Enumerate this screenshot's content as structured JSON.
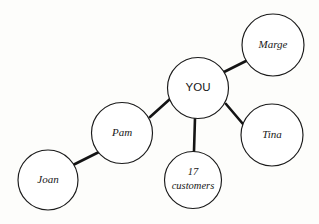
{
  "diagram": {
    "background_color": "#fdfdfb",
    "line_color": "#141414",
    "node_fill": "#ffffff",
    "node_stroke": "#1a1a1a",
    "nodes": [
      {
        "id": "you",
        "label": "YOU",
        "label_lines": [
          "YOU"
        ],
        "style": "roman",
        "font_size": 11.5,
        "cx": 198,
        "cy": 88,
        "r": 30.5
      },
      {
        "id": "marge",
        "label": "Marge",
        "label_lines": [
          "Marge"
        ],
        "style": "italic",
        "font_size": 11,
        "cx": 273,
        "cy": 45,
        "r": 31
      },
      {
        "id": "tina",
        "label": "Tina",
        "label_lines": [
          "Tina"
        ],
        "style": "italic",
        "font_size": 11,
        "cx": 272,
        "cy": 135,
        "r": 31
      },
      {
        "id": "pam",
        "label": "Pam",
        "label_lines": [
          "Pam"
        ],
        "style": "italic",
        "font_size": 11,
        "cx": 122,
        "cy": 133,
        "r": 30.5
      },
      {
        "id": "joan",
        "label": "Joan",
        "label_lines": [
          "Joan"
        ],
        "style": "italic",
        "font_size": 11,
        "cx": 48,
        "cy": 180,
        "r": 30
      },
      {
        "id": "customers",
        "label": "17 customers",
        "label_lines": [
          "17",
          "customers"
        ],
        "style": "italic",
        "font_size": 10.5,
        "cx": 193,
        "cy": 180,
        "r": 28.5
      }
    ],
    "edges": [
      {
        "id": "you-marge",
        "from": "you",
        "to": "marge",
        "x1": 224,
        "y1": 72,
        "x2": 248,
        "y2": 60
      },
      {
        "id": "you-tina",
        "from": "you",
        "to": "tina",
        "x1": 226,
        "y1": 104,
        "x2": 243,
        "y2": 124
      },
      {
        "id": "you-customers",
        "from": "you",
        "to": "customers",
        "x1": 195,
        "y1": 118,
        "x2": 194,
        "y2": 151
      },
      {
        "id": "you-pam",
        "from": "you",
        "to": "pam",
        "x1": 170,
        "y1": 99,
        "x2": 150,
        "y2": 117
      },
      {
        "id": "pam-joan",
        "from": "pam",
        "to": "joan",
        "x1": 99,
        "y1": 152,
        "x2": 73,
        "y2": 165
      }
    ]
  }
}
